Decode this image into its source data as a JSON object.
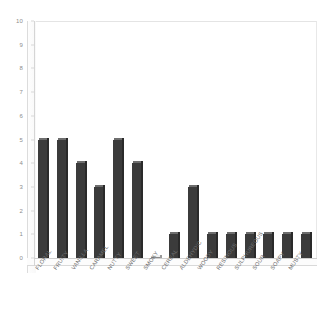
{
  "chart_data": {
    "type": "bar",
    "title": "",
    "subtitle": "",
    "xlabel": "",
    "ylabel": "",
    "ylim": [
      0,
      10
    ],
    "ytick_step": 1,
    "yticks": [
      "0",
      "1",
      "2",
      "3",
      "4",
      "5",
      "6",
      "7",
      "8",
      "9",
      "10"
    ],
    "grid": false,
    "legend": null,
    "style": "3d-column",
    "bar_color": "#3b3b3b",
    "categories": [
      "FLORAL",
      "FRUITY",
      "VANILLA",
      "CARAMEL",
      "NUTTY",
      "SWEET",
      "SMOKY",
      "CEREAL",
      "ALDEHYDIC",
      "WOODY",
      "RESINOUS",
      "SULPHUREOUS",
      "SOUR",
      "SOAPY",
      "MUSTY"
    ],
    "values": [
      5,
      5,
      4,
      3,
      5,
      4,
      0,
      1,
      3,
      1,
      1,
      1,
      1,
      1,
      1
    ]
  }
}
